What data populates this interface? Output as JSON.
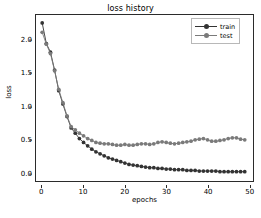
{
  "chart_data": {
    "type": "line",
    "title": "loss history",
    "xlabel": "epochs",
    "ylabel": "loss",
    "xlim": [
      -1.5,
      51.0
    ],
    "ylim": [
      -0.12,
      2.38
    ],
    "xticks": [
      0,
      10,
      20,
      30,
      40,
      50
    ],
    "xtick_labels": [
      "0",
      "10",
      "20",
      "30",
      "40",
      "50"
    ],
    "yticks": [
      0.0,
      0.5,
      1.0,
      1.5,
      2.0
    ],
    "ytick_labels": [
      "0.0",
      "0.5",
      "1.0",
      "1.5",
      "2.0"
    ],
    "grid": false,
    "legend_position": "upper right",
    "marker": "circle",
    "x": [
      0,
      1,
      2,
      3,
      4,
      5,
      6,
      7,
      8,
      9,
      10,
      11,
      12,
      13,
      14,
      15,
      16,
      17,
      18,
      19,
      20,
      21,
      22,
      23,
      24,
      25,
      26,
      27,
      28,
      29,
      30,
      31,
      32,
      33,
      34,
      35,
      36,
      37,
      38,
      39,
      40,
      41,
      42,
      43,
      44,
      45,
      46,
      47,
      48,
      49
    ],
    "series": [
      {
        "name": "train",
        "color": "#333333",
        "values": [
          2.26,
          1.95,
          1.82,
          1.55,
          1.24,
          1.04,
          0.85,
          0.68,
          0.6,
          0.52,
          0.46,
          0.41,
          0.36,
          0.32,
          0.29,
          0.26,
          0.23,
          0.21,
          0.19,
          0.17,
          0.15,
          0.13,
          0.12,
          0.11,
          0.1,
          0.09,
          0.08,
          0.08,
          0.07,
          0.07,
          0.06,
          0.06,
          0.05,
          0.05,
          0.05,
          0.04,
          0.04,
          0.04,
          0.03,
          0.03,
          0.03,
          0.03,
          0.03,
          0.02,
          0.02,
          0.02,
          0.02,
          0.02,
          0.02,
          0.02
        ]
      },
      {
        "name": "test",
        "color": "#7a7a7a",
        "values": [
          2.12,
          1.94,
          1.8,
          1.54,
          1.26,
          1.06,
          0.86,
          0.7,
          0.65,
          0.6,
          0.56,
          0.52,
          0.49,
          0.46,
          0.45,
          0.44,
          0.44,
          0.43,
          0.42,
          0.42,
          0.43,
          0.42,
          0.42,
          0.43,
          0.44,
          0.44,
          0.43,
          0.44,
          0.46,
          0.47,
          0.46,
          0.45,
          0.44,
          0.45,
          0.46,
          0.47,
          0.48,
          0.5,
          0.51,
          0.52,
          0.5,
          0.48,
          0.48,
          0.49,
          0.5,
          0.52,
          0.53,
          0.53,
          0.51,
          0.5
        ]
      }
    ]
  },
  "legend": {
    "entries": [
      {
        "label": "train",
        "color": "#333333"
      },
      {
        "label": "test",
        "color": "#7a7a7a"
      }
    ]
  }
}
